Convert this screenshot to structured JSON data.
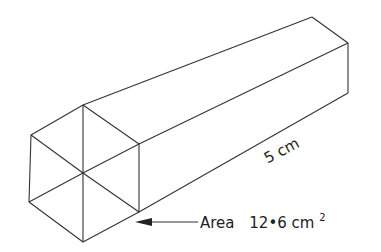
{
  "figure": {
    "length_label": "5 cm",
    "area_label_word": "Area",
    "area_value": "12•6 cm",
    "area_superscript": "2",
    "line_color": "#333333",
    "text_color": "#222222"
  }
}
